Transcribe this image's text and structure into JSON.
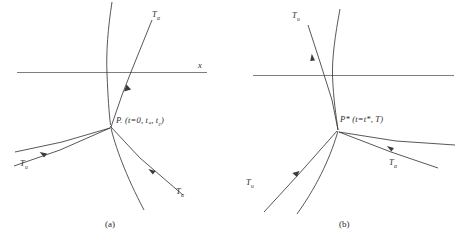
{
  "figure": {
    "background": "#ffffff",
    "stroke_color": "#3a3a3a",
    "axis_color": "#6e6e6e"
  },
  "panels": [
    {
      "id": "a",
      "caption": "(a)",
      "axis_label": "x",
      "point_label_main": "P",
      "point_label_sub": ".",
      "point_label_args": "(t=0, t",
      "point_label_args_sub1": "*",
      "point_label_args_mid": ", t",
      "point_label_args_sub2": "c",
      "point_label_args_end": ")",
      "point_label_full": "P. (t=0, t., t.)",
      "curves": [
        {
          "name": "alpha-plus-characteristic",
          "label": "T",
          "sub": "α",
          "subsub": "+"
        },
        {
          "name": "alpha-minus-characteristic",
          "label": "T",
          "sub": "α",
          "subsub": "−"
        },
        {
          "name": "u-characteristic",
          "label": "T",
          "sub": "u",
          "subsub": "0"
        }
      ],
      "labels": [
        {
          "name": "label-T-alpha-upper",
          "base": "T",
          "sub": "α",
          "subsub": ""
        },
        {
          "name": "label-T-u-lower-left",
          "base": "T",
          "sub": "u",
          "subsub": "0"
        },
        {
          "name": "label-T-alpha-lower-right",
          "base": "T",
          "sub": "α",
          "subsub": "0"
        }
      ]
    },
    {
      "id": "b",
      "caption": "(b)",
      "point_label_main": "P*",
      "point_label_args": "(t=t*, T)",
      "point_label_full": "P* (t=t*, T)",
      "labels": [
        {
          "name": "label-T-u-upper-left",
          "base": "T",
          "sub": "u",
          "subsub": ""
        },
        {
          "name": "label-T-u-lower-left",
          "base": "T",
          "sub": "u",
          "subsub": "0"
        },
        {
          "name": "label-T-alpha-lower-right",
          "base": "T",
          "sub": "α",
          "subsub": "0"
        }
      ]
    }
  ],
  "text": {
    "T": "T",
    "alpha": "α",
    "u": "u",
    "zero": "0",
    "x": "x",
    "caption_a": "(a)",
    "caption_b": "(b)",
    "p_a": "P",
    "p_a_dot": ".",
    "p_a_paren": "(t=0, t",
    "p_a_star": "*",
    "p_a_comma": ", t",
    "p_a_c": "c",
    "p_a_close": ")",
    "p_b": "P*",
    "p_b_paren": "(t=t*, T)"
  }
}
